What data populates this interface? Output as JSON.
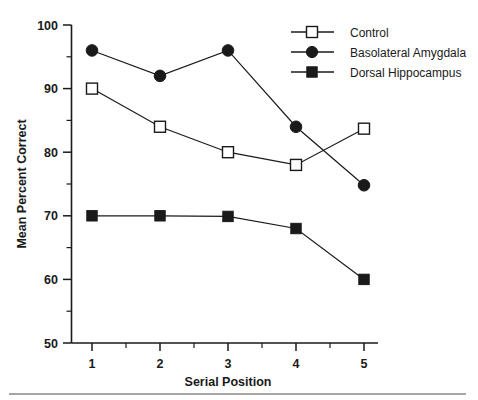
{
  "chart_data": {
    "type": "line",
    "title": "",
    "xlabel": "Serial Position",
    "ylabel": "Mean Percent Correct",
    "x": [
      1,
      2,
      3,
      4,
      5
    ],
    "categories": [
      "1",
      "2",
      "3",
      "4",
      "5"
    ],
    "xlim": [
      0.6,
      5.3
    ],
    "ylim": [
      50,
      100
    ],
    "ytick_labels": [
      "100",
      "90",
      "80",
      "70",
      "60",
      "50"
    ],
    "ytick_values": [
      100,
      90,
      80,
      70,
      60,
      50
    ],
    "yminor_values": [
      95,
      85,
      75,
      65,
      55
    ],
    "grid": false,
    "legend_position": "top-right",
    "series": [
      {
        "name": "Control",
        "marker": "open-square",
        "color": "#1a1a1a",
        "values": [
          90.0,
          84.0,
          80.0,
          78.0,
          83.7
        ]
      },
      {
        "name": "Basolateral Amygdala",
        "marker": "filled-circle",
        "color": "#1a1a1a",
        "values": [
          96.0,
          92.0,
          96.0,
          84.0,
          74.8
        ]
      },
      {
        "name": "Dorsal Hippocampus",
        "marker": "filled-square",
        "color": "#1a1a1a",
        "values": [
          70.0,
          70.0,
          69.9,
          68.0,
          60.0
        ]
      }
    ]
  },
  "axes": {
    "y_title": "Mean Percent Correct",
    "x_title": "Serial Position",
    "y_ticks": [
      "100",
      "90",
      "80",
      "70",
      "60",
      "50"
    ],
    "x_ticks": [
      "1",
      "2",
      "3",
      "4",
      "5"
    ]
  },
  "legend": {
    "entries": [
      {
        "label": "Control",
        "marker": "open-square"
      },
      {
        "label": "Basolateral Amygdala",
        "marker": "filled-circle"
      },
      {
        "label": "Dorsal Hippocampus",
        "marker": "filled-square"
      }
    ]
  }
}
